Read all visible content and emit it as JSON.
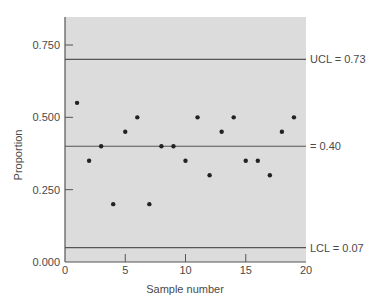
{
  "chart_data": {
    "type": "scatter",
    "title": "",
    "xlabel": "Sample number",
    "ylabel": "Proportion",
    "xlim": [
      0,
      20
    ],
    "ylim": [
      0,
      0.85
    ],
    "x_ticks": [
      0,
      5,
      10,
      15,
      20
    ],
    "x_tick_labels": [
      "0",
      "5",
      "10",
      "15",
      "20"
    ],
    "y_ticks": [
      0.0,
      0.25,
      0.5,
      0.75
    ],
    "y_tick_labels": [
      "0.000",
      "0.250",
      "0.500",
      "0.750"
    ],
    "grid": false,
    "series": [
      {
        "name": "Sample proportion",
        "x": [
          1,
          2,
          3,
          4,
          5,
          6,
          7,
          8,
          9,
          10,
          11,
          12,
          13,
          14,
          15,
          16,
          17,
          18,
          19
        ],
        "values": [
          0.55,
          0.35,
          0.4,
          0.2,
          0.45,
          0.5,
          0.2,
          0.4,
          0.4,
          0.35,
          0.5,
          0.3,
          0.45,
          0.5,
          0.35,
          0.35,
          0.3,
          0.45,
          0.5
        ]
      }
    ],
    "reference_lines": [
      {
        "name": "UCL",
        "y": 0.7,
        "label": "UCL = 0.73"
      },
      {
        "name": "Center",
        "y": 0.4,
        "label": "= 0.40"
      },
      {
        "name": "LCL",
        "y": 0.05,
        "label": "LCL = 0.07"
      }
    ],
    "colors": {
      "plot_background": "#dcdcdc",
      "point": "#222222",
      "line": "#555555"
    }
  }
}
